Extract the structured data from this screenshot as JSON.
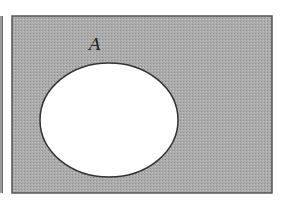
{
  "diagram": {
    "type": "venn",
    "universe": {
      "x": 12,
      "y": 16,
      "width": 260,
      "height": 177,
      "fill": "#a8a8a8",
      "stroke": "#555555",
      "shaded": true
    },
    "sets": [
      {
        "label": "A",
        "cx": 109,
        "cy": 120,
        "rx": 69,
        "ry": 57,
        "fill": "#ffffff",
        "stroke": "#333333",
        "shaded": false,
        "label_x": 89,
        "label_y": 50
      }
    ],
    "shaded_region": "complement of A"
  }
}
